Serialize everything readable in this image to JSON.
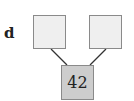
{
  "label": "d",
  "nodes": {
    "left": "",
    "right": "",
    "root": "42"
  },
  "colors": {
    "leaf": "#efefef",
    "root": "#cdcdcd"
  }
}
